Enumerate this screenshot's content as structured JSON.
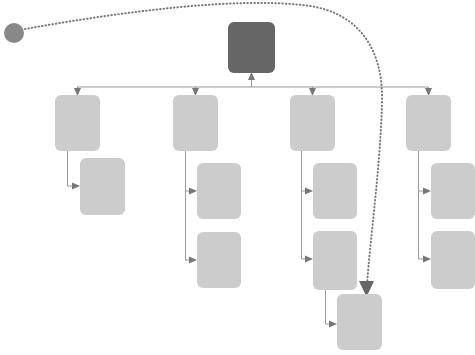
{
  "diagram": {
    "type": "flowchart",
    "title": "",
    "canvas": {
      "width": 475,
      "height": 355,
      "background": "#ffffff"
    },
    "colors": {
      "root_node_fill": "#666666",
      "node_fill": "#cccccc",
      "source_marker_fill": "#888888",
      "connector_stroke": "#999999",
      "arrowhead_fill": "#777777",
      "dotted_stroke": "#777777",
      "dotted_arrowhead_fill": "#666666",
      "background": "#ffffff"
    },
    "style": {
      "node_corner_radius": 6,
      "connector_stroke_width": 1,
      "dotted_stroke_width": 2,
      "dotted_dash_pattern": "0.5 3"
    },
    "nodes": [
      {
        "id": "source-marker",
        "label": "",
        "shape": "circle",
        "cx": 14,
        "cy": 33,
        "r": 10,
        "fill": "#888888",
        "level": "source"
      },
      {
        "id": "root",
        "label": "",
        "shape": "rounded-rect",
        "x": 228,
        "y": 22,
        "width": 47,
        "height": 51,
        "fill": "#666666",
        "level": "root"
      },
      {
        "id": "branch-1",
        "label": "",
        "shape": "rounded-rect",
        "x": 55,
        "y": 95,
        "width": 45,
        "height": 56,
        "fill": "#cccccc",
        "level": "branch"
      },
      {
        "id": "branch-2",
        "label": "",
        "shape": "rounded-rect",
        "x": 173,
        "y": 95,
        "width": 45,
        "height": 56,
        "fill": "#cccccc",
        "level": "branch"
      },
      {
        "id": "branch-3",
        "label": "",
        "shape": "rounded-rect",
        "x": 290,
        "y": 95,
        "width": 45,
        "height": 56,
        "fill": "#cccccc",
        "level": "branch"
      },
      {
        "id": "branch-4",
        "label": "",
        "shape": "rounded-rect",
        "x": 406,
        "y": 95,
        "width": 45,
        "height": 56,
        "fill": "#cccccc",
        "level": "branch"
      },
      {
        "id": "branch-1-child-1",
        "label": "",
        "shape": "rounded-rect",
        "x": 80,
        "y": 158,
        "width": 45,
        "height": 57,
        "fill": "#cccccc",
        "level": "leaf"
      },
      {
        "id": "branch-2-child-1",
        "label": "",
        "shape": "rounded-rect",
        "x": 197,
        "y": 163,
        "width": 44,
        "height": 56,
        "fill": "#cccccc",
        "level": "leaf"
      },
      {
        "id": "branch-2-child-2",
        "label": "",
        "shape": "rounded-rect",
        "x": 197,
        "y": 232,
        "width": 44,
        "height": 56,
        "fill": "#cccccc",
        "level": "leaf"
      },
      {
        "id": "branch-3-child-1",
        "label": "",
        "shape": "rounded-rect",
        "x": 313,
        "y": 163,
        "width": 44,
        "height": 56,
        "fill": "#cccccc",
        "level": "leaf"
      },
      {
        "id": "branch-3-child-2",
        "label": "",
        "shape": "rounded-rect",
        "x": 313,
        "y": 231,
        "width": 44,
        "height": 59,
        "fill": "#cccccc",
        "level": "leaf"
      },
      {
        "id": "branch-3-grandchild-1",
        "label": "",
        "shape": "rounded-rect",
        "x": 337,
        "y": 294,
        "width": 45,
        "height": 56,
        "fill": "#cccccc",
        "level": "sub-leaf"
      },
      {
        "id": "branch-4-child-1",
        "label": "",
        "shape": "rounded-rect",
        "x": 431,
        "y": 163,
        "width": 44,
        "height": 56,
        "fill": "#cccccc",
        "level": "leaf"
      },
      {
        "id": "branch-4-child-2",
        "label": "",
        "shape": "rounded-rect",
        "x": 431,
        "y": 231,
        "width": 44,
        "height": 58,
        "fill": "#cccccc",
        "level": "leaf"
      }
    ],
    "bus": {
      "y": 87,
      "x_start": 77,
      "x_end": 428,
      "stroke": "#999999"
    },
    "edges": [
      {
        "id": "edge-bus-to-root",
        "from": "bus",
        "to": "root",
        "style": "solid",
        "arrow": "up"
      },
      {
        "id": "edge-bus-to-branch-1",
        "from": "bus",
        "to": "branch-1",
        "style": "solid",
        "arrow": "down"
      },
      {
        "id": "edge-bus-to-branch-2",
        "from": "bus",
        "to": "branch-2",
        "style": "solid",
        "arrow": "down"
      },
      {
        "id": "edge-bus-to-branch-3",
        "from": "bus",
        "to": "branch-3",
        "style": "solid",
        "arrow": "down"
      },
      {
        "id": "edge-bus-to-branch-4",
        "from": "bus",
        "to": "branch-4",
        "style": "solid",
        "arrow": "down"
      },
      {
        "id": "edge-branch-1-to-child-1",
        "from": "branch-1",
        "to": "branch-1-child-1",
        "style": "solid",
        "arrow": "right"
      },
      {
        "id": "edge-branch-2-to-child-1",
        "from": "branch-2",
        "to": "branch-2-child-1",
        "style": "solid",
        "arrow": "right"
      },
      {
        "id": "edge-branch-2-to-child-2",
        "from": "branch-2",
        "to": "branch-2-child-2",
        "style": "solid",
        "arrow": "right"
      },
      {
        "id": "edge-branch-3-to-child-1",
        "from": "branch-3",
        "to": "branch-3-child-1",
        "style": "solid",
        "arrow": "right"
      },
      {
        "id": "edge-branch-3-to-child-2",
        "from": "branch-3",
        "to": "branch-3-child-2",
        "style": "solid",
        "arrow": "right"
      },
      {
        "id": "edge-branch-3-child-2-to-grandchild-1",
        "from": "branch-3-child-2",
        "to": "branch-3-grandchild-1",
        "style": "solid",
        "arrow": "right"
      },
      {
        "id": "edge-branch-4-to-child-1",
        "from": "branch-4",
        "to": "branch-4-child-1",
        "style": "solid",
        "arrow": "right"
      },
      {
        "id": "edge-branch-4-to-child-2",
        "from": "branch-4",
        "to": "branch-4-child-2",
        "style": "solid",
        "arrow": "right"
      },
      {
        "id": "edge-source-to-grandchild",
        "from": "source-marker",
        "to": "branch-3-grandchild-1",
        "style": "dotted",
        "arrow": "down"
      }
    ]
  }
}
